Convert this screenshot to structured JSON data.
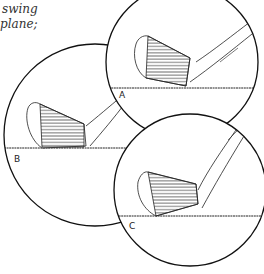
{
  "caption": {
    "line1": "swing",
    "line2": "plane;"
  },
  "panels": [
    {
      "label": "A",
      "description": "iron clubface at address, toe up"
    },
    {
      "label": "B",
      "description": "iron clubface at address, flat lie"
    },
    {
      "label": "C",
      "description": "iron clubface at address, upright"
    }
  ],
  "colors": {
    "ink": "#1a1a1a",
    "paper": "#ffffff"
  }
}
